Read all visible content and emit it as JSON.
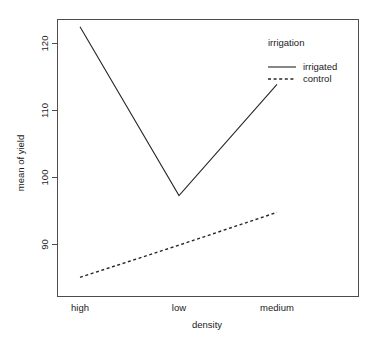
{
  "chart_data": {
    "type": "line",
    "title": "",
    "xlabel": "density",
    "ylabel": "mean of yield",
    "categories": [
      "high",
      "low",
      "medium"
    ],
    "series": [
      {
        "name": "irrigated",
        "values": [
          122.5,
          97.3,
          113.9
        ],
        "style": "solid"
      },
      {
        "name": "control",
        "values": [
          85.1,
          89.9,
          94.8
        ],
        "style": "dashed"
      }
    ],
    "yticks": [
      90,
      100,
      110,
      120
    ],
    "ytick_labels": [
      "90",
      "100",
      "110",
      "120"
    ],
    "ylim": [
      83.3,
      124.0
    ],
    "xlim": [
      0.75,
      3.25
    ],
    "grid": false,
    "legend": {
      "title": "irrigation",
      "position": "top-right",
      "entries": [
        {
          "label": "irrigated",
          "style": "solid"
        },
        {
          "label": "control",
          "style": "dashed"
        }
      ]
    }
  },
  "axes": {
    "y_title": "mean of yield",
    "x_title": "density",
    "y_tick_0": "90",
    "y_tick_1": "100",
    "y_tick_2": "110",
    "y_tick_3": "120",
    "x_cat_0": "high",
    "x_cat_1": "low",
    "x_cat_2": "medium"
  },
  "legend": {
    "title": "irrigation",
    "entry_0": "irrigated",
    "entry_1": "control"
  },
  "colors": {
    "line": "#262626",
    "axis": "#4d4d4d",
    "text": "#1a1a1a",
    "background": "#ffffff"
  }
}
